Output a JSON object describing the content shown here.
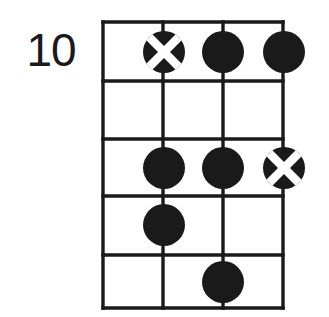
{
  "diagram": {
    "type": "guitar-chord-diagram",
    "position_label": "10",
    "strings_count": 4,
    "frets_count": 5,
    "colors": {
      "ink": "#1a1a1a",
      "background": "#ffffff",
      "marker_cross": "#ffffff"
    },
    "geometry": {
      "grid_left": 103,
      "grid_right": 283,
      "grid_top": 22,
      "grid_bottom": 308,
      "string_x": [
        103,
        163,
        223,
        283
      ],
      "fret_y": [
        22,
        81,
        139,
        196,
        255,
        308
      ],
      "marker_radius": 21
    },
    "markers": [
      {
        "name": "marker-x-string2-fret1",
        "style": "cross",
        "string": 2,
        "fret": 1,
        "cx": 164,
        "cy": 52
      },
      {
        "name": "marker-dot-string3-fret1",
        "style": "filled",
        "string": 3,
        "fret": 1,
        "cx": 223,
        "cy": 52
      },
      {
        "name": "marker-dot-string4-fret1",
        "style": "filled",
        "string": 4,
        "fret": 1,
        "cx": 284,
        "cy": 52
      },
      {
        "name": "marker-dot-string2-fret3",
        "style": "filled",
        "string": 2,
        "fret": 3,
        "cx": 164,
        "cy": 168
      },
      {
        "name": "marker-dot-string3-fret3",
        "style": "filled",
        "string": 3,
        "fret": 3,
        "cx": 223,
        "cy": 168
      },
      {
        "name": "marker-x-string4-fret3",
        "style": "cross",
        "string": 4,
        "fret": 3,
        "cx": 284,
        "cy": 168
      },
      {
        "name": "marker-dot-string2-fret4",
        "style": "filled",
        "string": 2,
        "fret": 4,
        "cx": 164,
        "cy": 225
      },
      {
        "name": "marker-dot-string3-fret5",
        "style": "filled",
        "string": 3,
        "fret": 5,
        "cx": 223,
        "cy": 282
      }
    ]
  }
}
